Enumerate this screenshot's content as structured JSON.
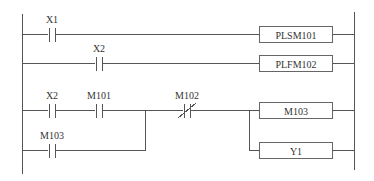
{
  "diagram": {
    "type": "ladder",
    "rungs": [
      {
        "contacts": [
          {
            "label": "X1",
            "type": "NO"
          }
        ],
        "output": {
          "label": "PLSM101"
        }
      },
      {
        "contacts": [
          {
            "label": "X2",
            "type": "NO"
          }
        ],
        "output": {
          "label": "PLFM102"
        }
      },
      {
        "contacts": [
          {
            "label": "X2",
            "type": "NO"
          },
          {
            "label": "M101",
            "type": "NO"
          },
          {
            "label": "M103",
            "type": "NO",
            "branch": "parallel"
          },
          {
            "label": "M102",
            "type": "NC"
          }
        ],
        "outputs": [
          {
            "label": "M103"
          },
          {
            "label": "Y1"
          }
        ]
      }
    ]
  },
  "labels": {
    "r1_c1": "X1",
    "r1_out": "PLSM101",
    "r2_c1": "X2",
    "r2_out": "PLFM102",
    "r3_c1": "X2",
    "r3_c2": "M101",
    "r3_c3": "M103",
    "r3_c4": "M102",
    "r3_out1": "M103",
    "r3_out2": "Y1"
  }
}
